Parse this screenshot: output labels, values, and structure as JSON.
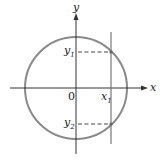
{
  "diagram": {
    "type": "circle-vertical-line-intersection",
    "colors": {
      "circle": "#8a8a8a",
      "axes": "#333333",
      "vertical_line": "#777777",
      "dashed": "#444444",
      "text": "#222222"
    },
    "labels": {
      "x_axis": "x",
      "y_axis": "y",
      "origin": "0",
      "x1_base": "x",
      "x1_sub": "1",
      "y1_base": "y",
      "y1_sub": "1",
      "y2_base": "y",
      "y2_sub": "2"
    }
  }
}
